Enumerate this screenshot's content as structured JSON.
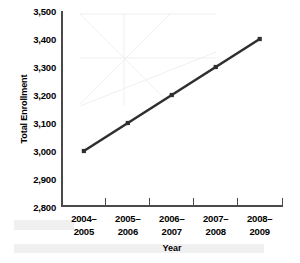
{
  "chart_data": {
    "type": "line",
    "title": "",
    "xlabel": "Year",
    "ylabel": "Total Enrollment",
    "categories": [
      "2004–2005",
      "2005–2006",
      "2006–2007",
      "2007–2008",
      "2008–2009"
    ],
    "category_lines": [
      [
        "2004–",
        "2005"
      ],
      [
        "2005–",
        "2006"
      ],
      [
        "2006–",
        "2007"
      ],
      [
        "2007–",
        "2008"
      ],
      [
        "2008–",
        "2009"
      ]
    ],
    "values": [
      3000,
      3100,
      3200,
      3300,
      3400
    ],
    "ylim": [
      2800,
      3500
    ],
    "yticks": [
      2800,
      2900,
      3000,
      3100,
      3200,
      3300,
      3400,
      3500
    ],
    "ytick_labels": [
      "2,800",
      "2,900",
      "3,000",
      "3,100",
      "3,200",
      "3,300",
      "3,400",
      "3,500"
    ],
    "grid": false,
    "legend": false,
    "series_color": "#2f2f2f",
    "marker": "square",
    "axis_color": "#4a4a4a"
  }
}
